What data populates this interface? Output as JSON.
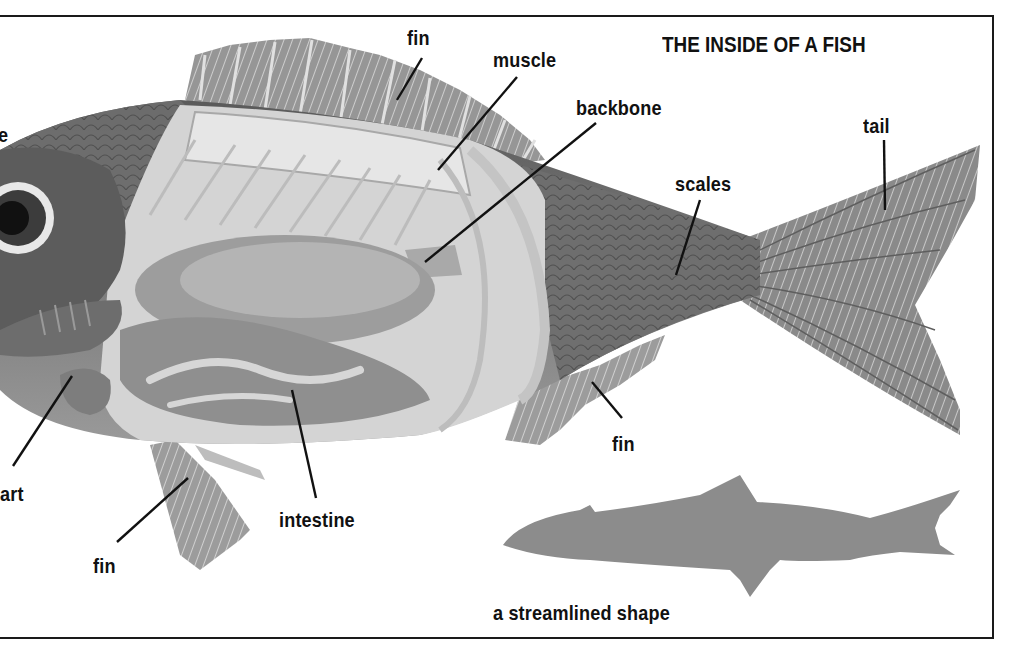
{
  "diagram": {
    "title": "THE INSIDE OF A FISH",
    "labels": {
      "fin_top": "fin",
      "muscle": "muscle",
      "backbone": "backbone",
      "tail": "tail",
      "scales": "scales",
      "fin_anal": "fin",
      "fin_pelvic": "fin",
      "intestine": "intestine",
      "heart_partial": "art",
      "eye_partial": "e"
    },
    "silhouette_caption": "a streamlined shape",
    "colors": {
      "ink": "#111111",
      "frame": "#1a1a1a",
      "silhouette": "#8c8c8c",
      "background": "#ffffff"
    }
  }
}
